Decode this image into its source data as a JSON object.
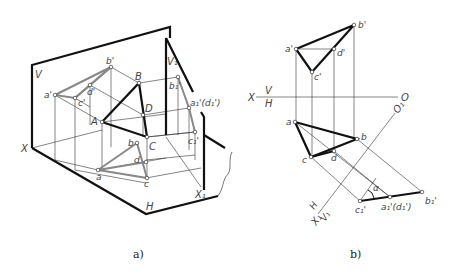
{
  "figure_a": {
    "caption": "a)",
    "plane_labels": {
      "V": "V",
      "V1": "V₁",
      "H": "H",
      "X": "X",
      "X1": "X₁"
    },
    "space_points": {
      "A": "A",
      "B": "B",
      "C": "C",
      "D": "D"
    },
    "v_projections": {
      "a": "a'",
      "b": "b'",
      "c": "c'",
      "d": "d'"
    },
    "h_projections": {
      "a": "a",
      "b": "b",
      "c": "c",
      "d": "d"
    },
    "v1_projections": {
      "b": "b₁'",
      "ad": "a₁'(d₁')",
      "c": "c₁'"
    }
  },
  "figure_b": {
    "caption": "b)",
    "axis_x": {
      "left": "X",
      "V": "V",
      "H": "H",
      "right": "O"
    },
    "axis_x1": {
      "end": "O₁",
      "start": "X₁",
      "H": "H",
      "V1": "V₁"
    },
    "v_projections": {
      "a": "a'",
      "b": "b'",
      "c": "c'",
      "d": "d'"
    },
    "h_projections": {
      "a": "a",
      "b": "b",
      "c": "c",
      "d": "d"
    },
    "v1_projections": {
      "c": "c₁'",
      "ad": "a₁'(d₁')",
      "b": "b₁'"
    },
    "angle_label": "α"
  }
}
